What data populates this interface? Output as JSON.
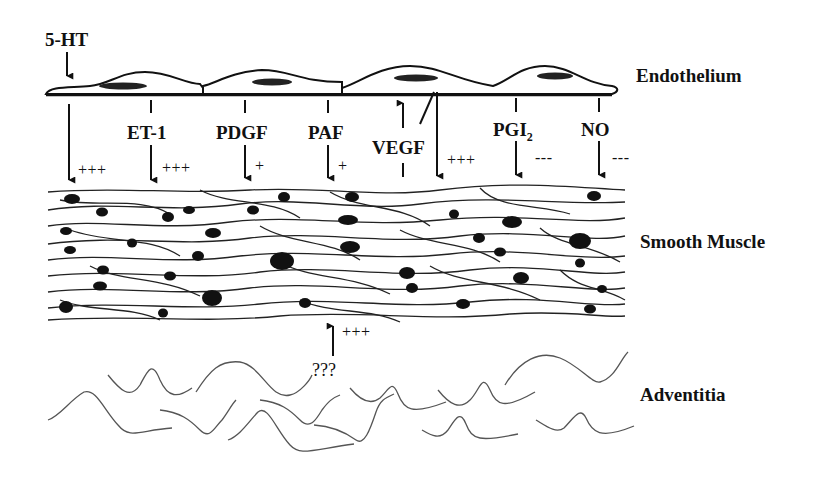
{
  "diagram": {
    "layers": {
      "endothelium": "Endothelium",
      "smooth_muscle": "Smooth Muscle",
      "adventitia": "Adventitia"
    },
    "stimulus": "5-HT",
    "mediators": [
      {
        "name": "ET-1",
        "effect": "+++"
      },
      {
        "name": "PDGF",
        "effect": "+"
      },
      {
        "name": "PAF",
        "effect": "+"
      },
      {
        "name": "VEGF",
        "effect": "+++"
      },
      {
        "name": "PGI",
        "subscript": "2",
        "effect": "---"
      },
      {
        "name": "NO",
        "effect": "---"
      }
    ],
    "direct_effect": "+++",
    "adventitia_signal": {
      "label": "???",
      "effect": "+++"
    },
    "colors": {
      "ink": "#111111",
      "background": "#ffffff"
    }
  }
}
